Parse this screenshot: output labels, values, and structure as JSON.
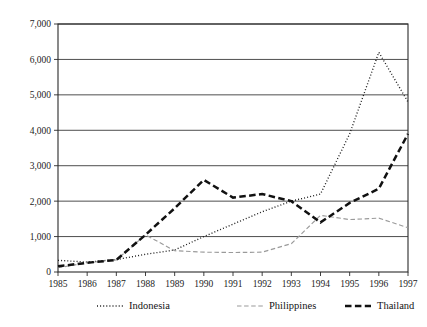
{
  "chart_data": {
    "type": "line",
    "title": "",
    "subtitle": "",
    "xlabel": "",
    "ylabel": "",
    "x": [
      1985,
      1986,
      1987,
      1988,
      1989,
      1990,
      1991,
      1992,
      1993,
      1994,
      1995,
      1996,
      1997
    ],
    "categories": [
      "1985",
      "1986",
      "1987",
      "1988",
      "1989",
      "1990",
      "1991",
      "1992",
      "1993",
      "1994",
      "1995",
      "1996",
      "1997"
    ],
    "xlim": [
      1985,
      1997
    ],
    "ylim": [
      0,
      7000
    ],
    "ytick_values": [
      0,
      1000,
      2000,
      3000,
      4000,
      5000,
      6000,
      7000
    ],
    "ytick_labels": [
      "0",
      "1,000",
      "2,000",
      "3,000",
      "4,000",
      "5,000",
      "6,000",
      "7,000"
    ],
    "grid": "horizontal",
    "legend_position": "bottom",
    "series": [
      {
        "name": "Indonesia",
        "line_style": "dotted",
        "color": "#1a1a1a",
        "values": [
          330,
          280,
          350,
          500,
          620,
          1000,
          1350,
          1700,
          2000,
          2200,
          3900,
          6200,
          4800
        ]
      },
      {
        "name": "Philippines",
        "line_style": "dashed-light",
        "color": "#9a9a9a",
        "values": [
          120,
          260,
          340,
          1050,
          600,
          560,
          550,
          560,
          800,
          1600,
          1480,
          1520,
          1250
        ]
      },
      {
        "name": "Thailand",
        "line_style": "dashed-bold",
        "color": "#111111",
        "values": [
          160,
          260,
          340,
          1050,
          1800,
          2600,
          2100,
          2200,
          2000,
          1400,
          1950,
          2350,
          3900
        ]
      }
    ]
  },
  "legend": {
    "items": [
      {
        "label": "Indonesia",
        "swatch": "dotted-line-swatch"
      },
      {
        "label": "Philippines",
        "swatch": "dashed-light-line-swatch"
      },
      {
        "label": "Thailand",
        "swatch": "dashed-bold-line-swatch"
      }
    ]
  }
}
